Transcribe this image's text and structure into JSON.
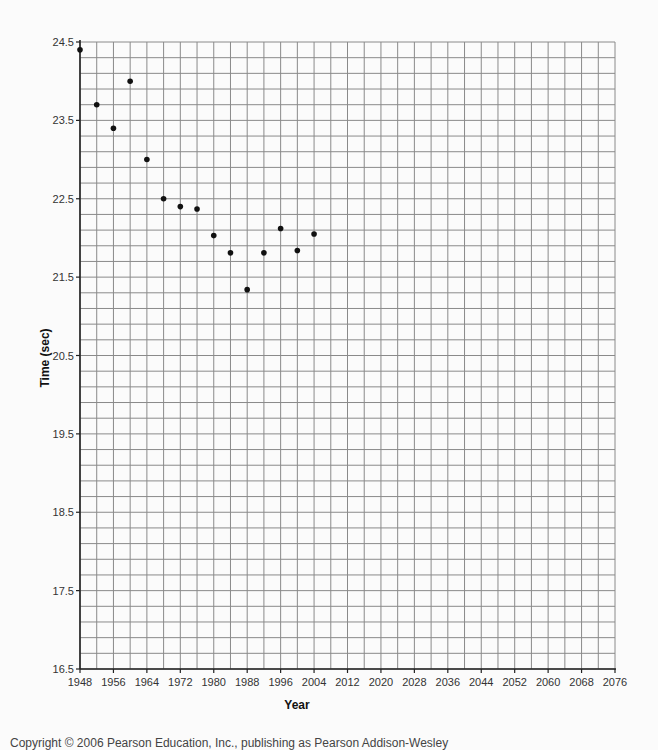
{
  "chart_data": {
    "type": "scatter",
    "title": "",
    "xlabel": "Year",
    "ylabel": "Time (sec)",
    "xlim": [
      1948,
      2076
    ],
    "ylim": [
      16.5,
      24.5
    ],
    "x_ticks": [
      "1948",
      "1956",
      "1964",
      "1972",
      "1980",
      "1988",
      "1996",
      "2004",
      "2012",
      "2020",
      "2028",
      "2036",
      "2044",
      "2052",
      "2060",
      "2068",
      "2076"
    ],
    "y_ticks": [
      "24.5",
      "23.5",
      "22.5",
      "21.5",
      "20.5",
      "19.5",
      "18.5",
      "17.5",
      "16.5"
    ],
    "grid": {
      "on": true,
      "x_minor_step": 4,
      "y_minor_step": 0.2
    },
    "legend": null,
    "series": [
      {
        "name": "Olympic times",
        "x": [
          1948,
          1952,
          1956,
          1960,
          1964,
          1968,
          1972,
          1976,
          1980,
          1984,
          1988,
          1992,
          1996,
          2000,
          2004
        ],
        "y": [
          24.4,
          23.7,
          23.4,
          24.0,
          23.0,
          22.5,
          22.4,
          22.37,
          22.03,
          21.81,
          21.34,
          21.81,
          22.12,
          21.84,
          22.05
        ]
      }
    ],
    "colors": {
      "points": "#111111",
      "grid": "#8a8a8a",
      "axis": "#222222"
    }
  },
  "footer": {
    "copyright": "Copyright © 2006 Pearson Education, Inc., publishing as Pearson Addison-Wesley"
  }
}
